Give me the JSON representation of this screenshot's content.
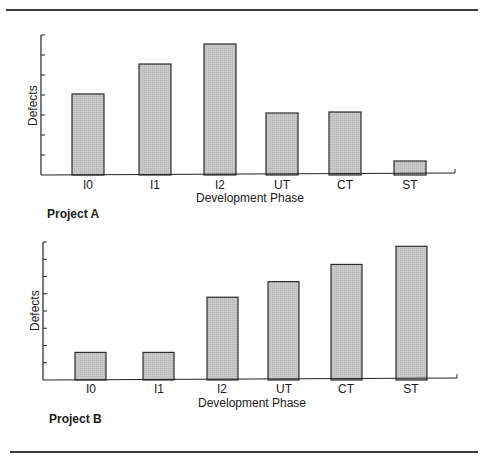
{
  "figure": {
    "rule_color": "#3a3a3a",
    "bar_fill": "#c9c9c9",
    "bar_stroke": "#2a2a2a"
  },
  "chart_data": [
    {
      "type": "bar",
      "title": "Project A",
      "xlabel": "Development Phase",
      "ylabel": "Defects",
      "categories": [
        "I0",
        "I1",
        "I2",
        "UT",
        "CT",
        "ST"
      ],
      "values": [
        4.05,
        5.55,
        6.55,
        3.1,
        3.15,
        0.7
      ],
      "value_units": "y-axis tick intervals (axis unlabeled)",
      "ylim": [
        0,
        7
      ],
      "y_ticks": 7,
      "y_tick_labels": [],
      "grid": false,
      "legend": null
    },
    {
      "type": "bar",
      "title": "Project B",
      "xlabel": "Development Phase",
      "ylabel": "Defects",
      "categories": [
        "I0",
        "I1",
        "I2",
        "UT",
        "CT",
        "ST"
      ],
      "values": [
        1.6,
        1.6,
        4.8,
        5.7,
        6.7,
        7.75
      ],
      "value_units": "y-axis tick intervals (axis unlabeled)",
      "ylim": [
        0,
        8
      ],
      "y_ticks": 8,
      "y_tick_labels": [],
      "grid": false,
      "legend": null
    }
  ]
}
